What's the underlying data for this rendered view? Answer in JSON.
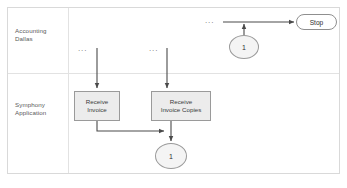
{
  "diagram": {
    "type": "swimlane-flowchart",
    "colors": {
      "frame_border": "#d9d9d9",
      "lane_divider": "#e2e2e2",
      "task_fill": "#ececec",
      "task_border": "#9a9a9a",
      "connector_fill": "#f4f4f4",
      "connector_border": "#9a9a9a",
      "terminator_fill": "#ffffff",
      "terminator_border": "#8f8f8f",
      "flow_line": "#4a4a4a",
      "text": "#3a3a3a",
      "lane_label_text": "#5a5a5a",
      "ellipsis": "#6f6f6f"
    },
    "lanes": [
      {
        "id": "accounting-dallas",
        "label": "Accounting\nDallas"
      },
      {
        "id": "symphony-application",
        "label": "Symphony\nApplication"
      }
    ],
    "nodes": {
      "task_receive_invoice": {
        "label": "Receive\nInvoice",
        "lane": "symphony-application",
        "shape": "rectangle"
      },
      "task_receive_invoice_copies": {
        "label": "Receive\nInvoice Copies",
        "lane": "symphony-application",
        "shape": "rectangle"
      },
      "connector_top": {
        "label": "1",
        "lane": "accounting-dallas",
        "shape": "circle"
      },
      "connector_bottom": {
        "label": "1",
        "lane": "symphony-application",
        "shape": "circle"
      },
      "terminator_stop": {
        "label": "Stop",
        "lane": "accounting-dallas",
        "shape": "rounded-rectangle"
      }
    },
    "ellipsis_marks": {
      "invoice": "...",
      "invoice_copies": "...",
      "stop_flow": "..."
    },
    "flows": [
      {
        "id": "flow-into-receive-invoice",
        "from": "ellipsis-invoice",
        "to": "task_receive_invoice",
        "direction": "down"
      },
      {
        "id": "flow-into-receive-invoice-copies",
        "from": "ellipsis-invoice-copies",
        "to": "task_receive_invoice_copies",
        "direction": "down"
      },
      {
        "id": "flow-invoice-to-copies-merge",
        "from": "task_receive_invoice",
        "to": "task_receive_invoice_copies",
        "direction": "down-right"
      },
      {
        "id": "flow-copies-to-connector",
        "from": "task_receive_invoice_copies",
        "to": "connector_bottom",
        "direction": "down"
      },
      {
        "id": "flow-connector-to-stop-line",
        "from": "connector_top",
        "to": "flow-to-stop",
        "direction": "up"
      },
      {
        "id": "flow-to-stop",
        "from": "ellipsis-stop-flow",
        "to": "terminator_stop",
        "direction": "right"
      }
    ]
  }
}
